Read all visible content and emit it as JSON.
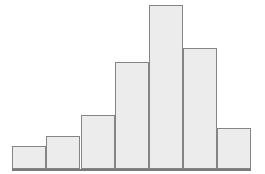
{
  "figure": {
    "background_color": "#ffffff",
    "width": 265,
    "height": 174,
    "caption": ""
  },
  "style": {
    "bar_fill_color": "#ececec",
    "bar_border_color": "#858585",
    "axis_color": "#7a7a7a",
    "bar_border_width_px": 1.5
  },
  "geometry": {
    "baseline_y": 169,
    "plot_left_x": 12,
    "plot_right_x": 251,
    "bar_width_px": 34.1
  },
  "chart_data": {
    "type": "bar",
    "title": "",
    "subtitle": "",
    "xlabel": "",
    "ylabel": "",
    "categories": [
      "1",
      "2",
      "3",
      "4",
      "5",
      "6",
      "7"
    ],
    "values": [
      23,
      33,
      54,
      107,
      164,
      121,
      41
    ],
    "bar_tops_px": [
      146,
      136,
      115,
      62,
      5,
      48,
      128
    ],
    "bar_lefts_px": [
      12,
      46,
      81,
      115,
      149,
      183,
      217
    ],
    "xlim": [
      0,
      7
    ],
    "ylim": [
      0,
      170
    ],
    "grid": false,
    "legend": null,
    "annotations": [],
    "tick_labels_visible": false,
    "axis_labels_visible": false,
    "description": "Unlabeled histogram with seven contiguous bars forming a roughly bell-shaped, slightly right-skewed distribution peaking at the fifth bar."
  }
}
